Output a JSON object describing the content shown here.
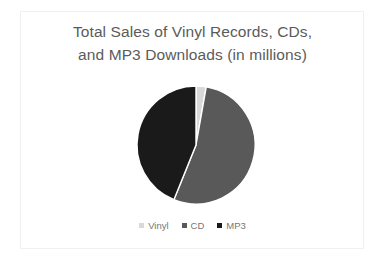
{
  "slide": {
    "background_color": "#ffffff",
    "frame_border_color": "#f0f0f0"
  },
  "chart_data": {
    "type": "pie",
    "title": "Total Sales of Vinyl Records, CDs,\nand MP3 Downloads (in millions)",
    "title_color": "#5b5b5b",
    "xlabel": "",
    "ylabel": "",
    "grid": false,
    "legend_position": "bottom",
    "categories": [
      "Vinyl",
      "CD",
      "MP3"
    ],
    "values": [
      3,
      53,
      44
    ],
    "percentages": [
      "3%",
      "53%",
      "44%"
    ],
    "start_angle_deg": 0,
    "direction": "clockwise",
    "slices": [
      {
        "label": "Vinyl",
        "value": 3,
        "percent": 3,
        "color": "#d9d9d9",
        "start_angle_deg": 0,
        "end_angle_deg": 10
      },
      {
        "label": "CD",
        "value": 53,
        "percent": 53,
        "color": "#595959",
        "start_angle_deg": 10,
        "end_angle_deg": 202
      },
      {
        "label": "MP3",
        "value": 44,
        "percent": 44,
        "color": "#1a1a1a",
        "start_angle_deg": 202,
        "end_angle_deg": 360
      }
    ],
    "geometry": {
      "center_x": 66,
      "center_y": 66,
      "radius": 59,
      "separator_color": "#ffffff",
      "separator_width": 1.4
    }
  },
  "legend": {
    "items": [
      {
        "label": "Vinyl",
        "color": "#d9d9d9"
      },
      {
        "label": "CD",
        "color": "#595959"
      },
      {
        "label": "MP3",
        "color": "#1a1a1a"
      }
    ],
    "text_color": "#767676"
  }
}
